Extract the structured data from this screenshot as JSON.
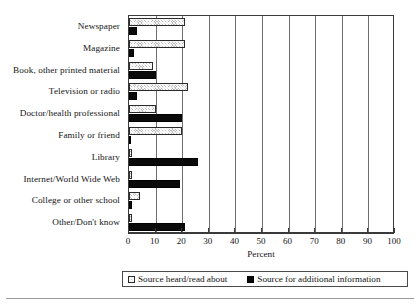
{
  "chart_data": {
    "type": "bar",
    "orientation": "horizontal",
    "title": "",
    "xlabel": "Percent",
    "ylabel": "",
    "xlim": [
      0,
      100
    ],
    "xticks": [
      0,
      10,
      20,
      30,
      40,
      50,
      60,
      70,
      80,
      90,
      100
    ],
    "grid": true,
    "grid_axis": "x",
    "legend_position": "bottom",
    "categories": [
      "Newspaper",
      "Magazine",
      "Book, other printed material",
      "Television or radio",
      "Doctor/health professional",
      "Family or friend",
      "Library",
      "Internet/World Wide Web",
      "College or other school",
      "Other/Don't know"
    ],
    "series": [
      {
        "name": "Source heard/read about",
        "pattern": "hatched",
        "color": "#b9b9b9",
        "values": [
          21,
          21,
          9,
          22,
          10,
          20,
          1,
          1,
          4,
          1
        ]
      },
      {
        "name": "Source for additional information",
        "pattern": "solid",
        "color": "#0a0a0a",
        "values": [
          3,
          2,
          10,
          3,
          20,
          0,
          26,
          19,
          1,
          21
        ]
      }
    ]
  },
  "axis": {
    "x_title": "Percent",
    "tick_labels": [
      "0",
      "10",
      "20",
      "30",
      "40",
      "50",
      "60",
      "70",
      "80",
      "90",
      "100"
    ]
  },
  "legend": {
    "entries": [
      {
        "label": "Source heard/read about",
        "swatch": "hatched-swatch"
      },
      {
        "label": "Source for additional information",
        "swatch": "solid-black-swatch"
      }
    ]
  }
}
